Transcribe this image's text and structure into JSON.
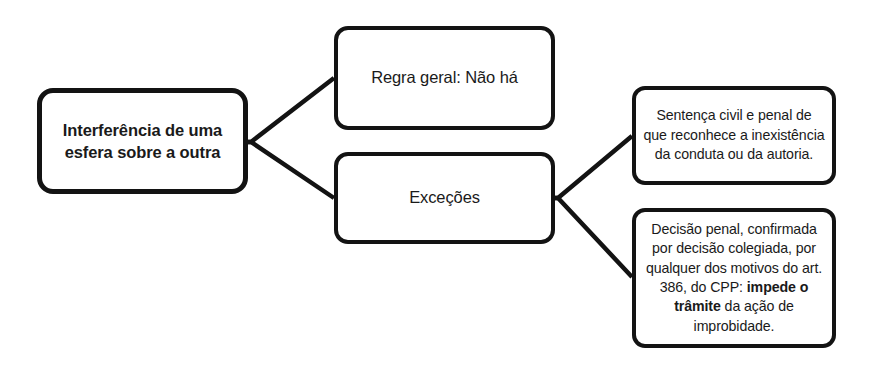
{
  "diagram": {
    "title": "Interferência de uma esfera sobre a outra",
    "style": {
      "background": "#ffffff",
      "box_border_color": "#131313",
      "text_color": "#1a1a1a",
      "connector_color": "#131313"
    },
    "nodes": {
      "root": {
        "label": "Interferência de uma esfera sobre a outra",
        "bold": true
      },
      "rule": {
        "label": "Regra geral: Não há"
      },
      "exceptions": {
        "label": "Exceções"
      },
      "exception_1": {
        "label": "Sentença civil e penal de que reconhece a inexistência da conduta ou da autoria."
      },
      "exception_2": {
        "prefix": "Decisão penal, confirmada por decisão colegiada, por qualquer dos motivos do art. 386, do CPP: ",
        "emphasis": "impede o trâmite",
        "suffix": " da ação de improbidade."
      }
    },
    "connectors": [
      {
        "name": "root-to-rule",
        "from": "root",
        "to": "rule"
      },
      {
        "name": "root-to-exceptions",
        "from": "root",
        "to": "exceptions"
      },
      {
        "name": "exceptions-to-exception-1",
        "from": "exceptions",
        "to": "exception_1"
      },
      {
        "name": "exceptions-to-exception-2",
        "from": "exceptions",
        "to": "exception_2"
      }
    ]
  }
}
